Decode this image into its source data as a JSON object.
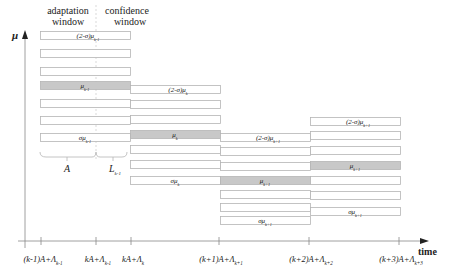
{
  "header": {
    "adaptation_window_line1": "adaptation",
    "adaptation_window_line2": "window",
    "confidence_window_line1": "confidence",
    "confidence_window_line2": "window"
  },
  "axes": {
    "y_label": "μ",
    "x_label": "time",
    "ticks": [
      {
        "x": 41,
        "pre": "(k-1)A+Λ",
        "sub": "k-1"
      },
      {
        "x": 96,
        "pre": "kA+Λ",
        "sub": "k-1"
      },
      {
        "x": 131,
        "pre": "kA+Λ",
        "sub": "k"
      },
      {
        "x": 219,
        "pre": "(k+1)A+Λ",
        "sub": "k+1"
      },
      {
        "x": 309,
        "pre": "(k+2)A+Λ",
        "sub": "k+2"
      },
      {
        "x": 399,
        "pre": "(k+3)A+Λ",
        "sub": "k+3"
      }
    ]
  },
  "brace": {
    "label_A": "A",
    "label_L": "L",
    "label_L_sub": "k-1"
  },
  "columns": [
    {
      "name": "k-1",
      "x": 40,
      "width": 90,
      "rows": [
        31,
        49,
        67,
        81,
        99,
        116,
        133
      ],
      "shaded_index": 3,
      "labels": {
        "top": {
          "pre": "(2-σ)μ",
          "sub": "k-1"
        },
        "mid": {
          "pre": "μ",
          "sub": "k-1"
        },
        "bottom": {
          "pre": "σμ",
          "sub": "k-1"
        }
      }
    },
    {
      "name": "k",
      "x": 130,
      "width": 90,
      "rows": [
        85,
        100,
        115,
        130,
        145,
        160,
        176
      ],
      "shaded_index": 3,
      "labels": {
        "top": {
          "pre": "(2-σ)μ",
          "sub": "k"
        },
        "mid": {
          "pre": "μ",
          "sub": "k"
        },
        "bottom": {
          "pre": "σμ",
          "sub": "k"
        }
      }
    },
    {
      "name": "k+1",
      "x": 220,
      "width": 90,
      "rows": [
        133,
        147,
        162,
        176,
        190,
        203,
        216
      ],
      "shaded_index": 3,
      "labels": {
        "top": {
          "pre": "(2-σ)μ",
          "sub": "k+1"
        },
        "mid": {
          "pre": "μ",
          "sub": "k+1"
        },
        "bottom": {
          "pre": "σμ",
          "sub": "k+1"
        }
      }
    },
    {
      "name": "k+2",
      "x": 310,
      "width": 90,
      "rows": [
        117,
        131,
        146,
        161,
        176,
        191,
        207
      ],
      "shaded_index": 3,
      "labels": {
        "top": {
          "pre": "(2-σ)μ",
          "sub": "k+1"
        },
        "mid": {
          "pre": "μ",
          "sub": "k+1"
        },
        "bottom": {
          "pre": "σμ",
          "sub": "k+1"
        }
      }
    }
  ],
  "colors": {
    "bar_stroke": "#b5b5b5",
    "bar_shaded": "#c8c8c8",
    "axis": "#888888",
    "text": "#222222"
  }
}
